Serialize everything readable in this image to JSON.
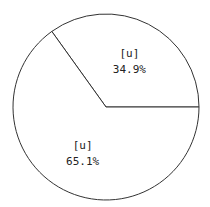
{
  "chart_data": {
    "type": "pie",
    "title": "",
    "slices": [
      {
        "label": "[u]",
        "value": 34.9,
        "value_label": "34.9%"
      },
      {
        "label": "[u]",
        "value": 65.1,
        "value_label": "65.1%"
      }
    ],
    "start_angle_deg": 0,
    "direction": "counterclockwise",
    "legend": "none",
    "slice_color": "#ffffff",
    "edge_color": "#333333"
  }
}
